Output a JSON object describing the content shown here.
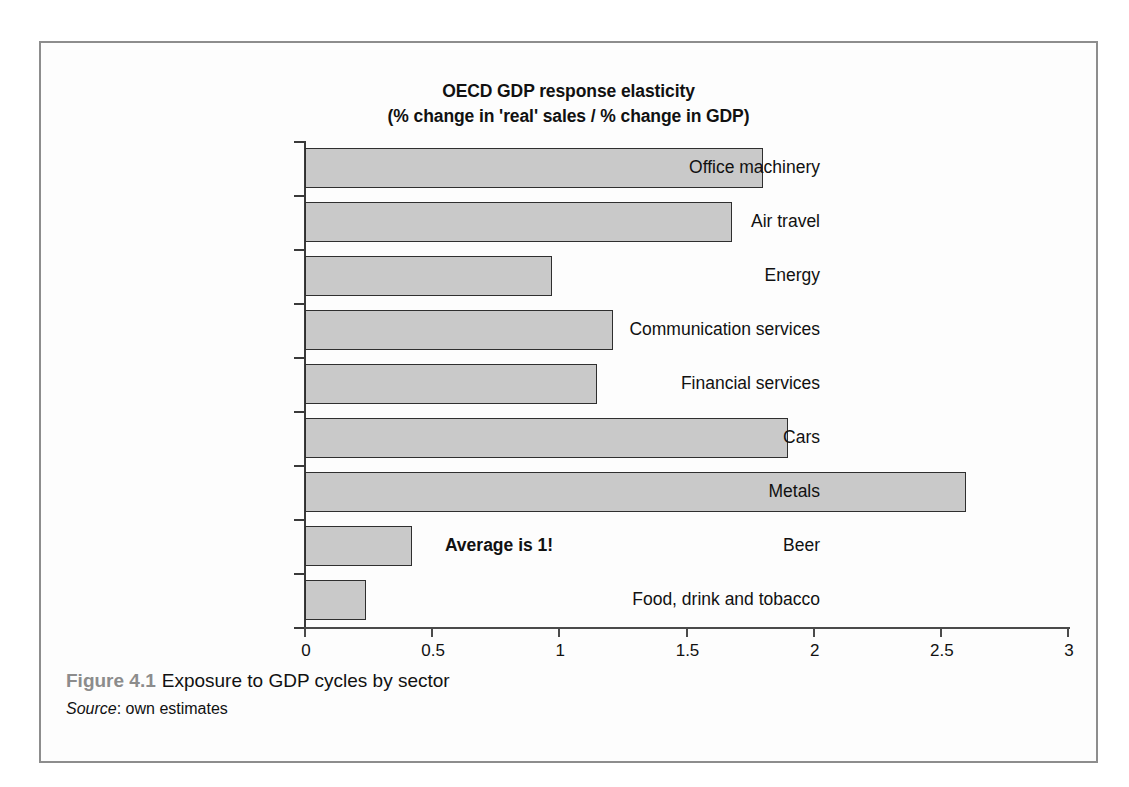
{
  "chart_data": {
    "type": "bar",
    "orientation": "horizontal",
    "title": "OECD GDP response elasticity",
    "subtitle": "(% change in 'real' sales / % change in GDP)",
    "xlabel": "",
    "ylabel": "",
    "xlim": [
      0,
      3
    ],
    "xticks": [
      "0",
      "0.5",
      "1",
      "1.5",
      "2",
      "2.5",
      "3"
    ],
    "xtick_values": [
      0,
      0.5,
      1,
      1.5,
      2,
      2.5,
      3
    ],
    "grid": false,
    "legend": false,
    "categories": [
      "Office machinery",
      "Air travel",
      "Energy",
      "Communication services",
      "Financial services",
      "Cars",
      "Metals",
      "Beer",
      "Food, drink and tobacco"
    ],
    "values": [
      1.8,
      1.68,
      0.97,
      1.21,
      1.15,
      1.9,
      2.6,
      0.42,
      0.24
    ],
    "bar_fill_color": "#c9c9c9",
    "bar_edge_color": "#2f2f2f",
    "annotations": [
      {
        "text": "Average is 1!",
        "x": 0.55,
        "category_index": 7
      }
    ]
  },
  "annotation": {
    "average_note": "Average is 1!"
  },
  "caption": {
    "figure_number": "Figure 4.1",
    "figure_title": "Exposure to GDP cycles by sector",
    "source_label": "Source",
    "source_separator": ": ",
    "source_value": "own estimates"
  },
  "colors": {
    "frame_border": "#8d8d8d",
    "axis": "#3a3a3a",
    "bar_fill": "#c9c9c9",
    "bar_edge": "#2f2f2f",
    "caption_number": "#8c8c8c",
    "text": "#111111"
  }
}
